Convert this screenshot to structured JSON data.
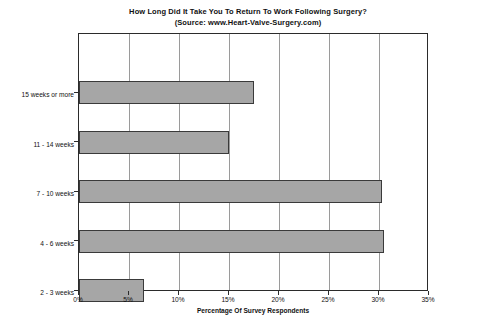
{
  "chart_data": {
    "type": "bar",
    "orientation": "horizontal",
    "title": "How Long Did It Take You To Return To Work Following Surgery?",
    "subtitle": "(Source: www.Heart-Valve-Surgery.com)",
    "categories": [
      "2 - 3 weeks",
      "4 - 6 weeks",
      "7 - 10 weeks",
      "11 - 14 weeks",
      "15 weeks or more"
    ],
    "values": [
      6.5,
      30.5,
      30.3,
      15.0,
      17.5
    ],
    "xlabel": "Percentage Of Survey Respondents",
    "ylabel": "",
    "xlim": [
      0,
      35
    ],
    "xticks": [
      0,
      5,
      10,
      15,
      20,
      25,
      30,
      35
    ],
    "xtick_labels": [
      "0%",
      "5%",
      "10%",
      "15%",
      "20%",
      "25%",
      "30%",
      "35%"
    ],
    "grid": "vertical",
    "legend": "none",
    "bar_color": "#a6a6a6",
    "bar_border_color": "#3a3a3a",
    "axis_color": "#2b2b2b",
    "grid_color": "#9a9a9a",
    "background": "#ffffff"
  }
}
